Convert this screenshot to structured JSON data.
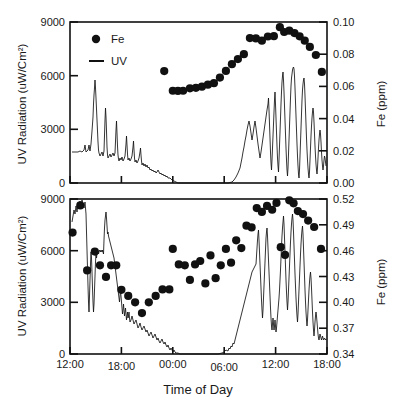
{
  "figure": {
    "background_color": "#ffffff",
    "ink_color": "#111111",
    "xlabel": "Time of Day",
    "panels": [
      {
        "id": "top-panel",
        "left_axis_title": "UV Radiation (uW/Cm²)",
        "right_axis_title": "Fe (ppm)",
        "left_ticks": [
          "0",
          "3000",
          "6000",
          "9000"
        ],
        "right_ticks": [
          "0.00",
          "0.02",
          "0.04",
          "0.06",
          "0.08",
          "0.10"
        ],
        "x_ticks": [
          "12:00",
          "18:00",
          "00:00",
          "06:00",
          "12:00",
          "18:00"
        ],
        "legend": [
          {
            "label": "Fe",
            "marker": "filled-circle"
          },
          {
            "label": "UV",
            "marker": "line"
          }
        ]
      },
      {
        "id": "bottom-panel",
        "left_axis_title": "UV Radiation (uW/Cm²)",
        "right_axis_title": "Fe (ppm)",
        "left_ticks": [
          "0",
          "3000",
          "6000",
          "9000"
        ],
        "right_ticks": [
          "0.34",
          "0.37",
          "0.40",
          "0.43",
          "0.46",
          "0.49",
          "0.52"
        ],
        "x_ticks": [
          "12:00",
          "18:00",
          "00:00",
          "06:00",
          "12:00",
          "18:00"
        ]
      }
    ]
  },
  "chart_data": [
    {
      "type": "scatter",
      "id": "top-panel",
      "title": "",
      "xlabel": "Time of Day",
      "ylabel": "UV Radiation (uW/Cm²)",
      "y2label": "Fe (ppm)",
      "xlim": [
        12,
        42
      ],
      "x_tick_values": [
        12,
        18,
        24,
        30,
        36,
        42
      ],
      "x_tick_labels": [
        "12:00",
        "18:00",
        "00:00",
        "06:00",
        "12:00",
        "18:00"
      ],
      "ylim": [
        0,
        9000
      ],
      "y_tick_values": [
        0,
        3000,
        6000,
        9000
      ],
      "y2lim": [
        0.0,
        0.1
      ],
      "y2_tick_values": [
        0.0,
        0.02,
        0.04,
        0.06,
        0.08,
        0.1
      ],
      "grid": false,
      "legend_position": "upper-left",
      "series": [
        {
          "name": "Fe",
          "type": "scatter",
          "axis": "y2",
          "marker": "filled-circle",
          "color": "#111111",
          "x": [
            23.0,
            24.0,
            24.6,
            25.2,
            26.0,
            26.7,
            27.4,
            28.1,
            28.8,
            29.5,
            30.2,
            30.9,
            31.6,
            32.3,
            33.0,
            33.7,
            34.4,
            35.1,
            35.8,
            36.5,
            37.0,
            37.6,
            38.2,
            38.8,
            39.4,
            40.0,
            40.7,
            41.4
          ],
          "y": [
            0.0695,
            0.0573,
            0.0572,
            0.0573,
            0.0588,
            0.0591,
            0.0598,
            0.0611,
            0.062,
            0.0655,
            0.0696,
            0.0738,
            0.077,
            0.08,
            0.09,
            0.0898,
            0.0884,
            0.091,
            0.0912,
            0.0968,
            0.0938,
            0.0946,
            0.0931,
            0.0911,
            0.0884,
            0.0845,
            0.0795,
            0.069
          ]
        },
        {
          "name": "UV",
          "type": "line",
          "axis": "y1",
          "color": "#111111",
          "description": "Spiky UV radiation trace: morning-to-afternoon spikes near 12:00-18:00 reaching ~5800, decaying to 0 after ~19:30; flat zero overnight; rising from ~06:30 to broad spiky plateau 09:00-16:00 peaking ~8000; falls off after 17:00."
        }
      ]
    },
    {
      "type": "scatter",
      "id": "bottom-panel",
      "title": "",
      "xlabel": "Time of Day",
      "ylabel": "UV Radiation (uW/Cm²)",
      "y2label": "Fe (ppm)",
      "xlim": [
        12,
        42
      ],
      "x_tick_values": [
        12,
        18,
        24,
        30,
        36,
        42
      ],
      "x_tick_labels": [
        "12:00",
        "18:00",
        "00:00",
        "06:00",
        "12:00",
        "18:00"
      ],
      "ylim": [
        0,
        9000
      ],
      "y_tick_values": [
        0,
        3000,
        6000,
        9000
      ],
      "y2lim": [
        0.34,
        0.52
      ],
      "y2_tick_values": [
        0.34,
        0.37,
        0.4,
        0.43,
        0.46,
        0.49,
        0.52
      ],
      "grid": false,
      "legend_position": "none",
      "series": [
        {
          "name": "Fe",
          "type": "scatter",
          "axis": "y2",
          "marker": "filled-circle",
          "color": "#111111",
          "x": [
            12.3,
            13.2,
            14.0,
            14.9,
            15.5,
            16.2,
            16.8,
            17.4,
            18.0,
            18.8,
            19.6,
            20.4,
            21.2,
            22.0,
            22.8,
            23.6,
            24.0,
            24.7,
            25.4,
            26.0,
            26.6,
            27.2,
            27.8,
            28.4,
            29.0,
            29.6,
            30.2,
            30.8,
            31.4,
            32.0,
            32.6,
            33.2,
            33.8,
            34.4,
            35.0,
            35.6,
            36.1,
            36.6,
            37.1,
            37.6,
            38.1,
            38.6,
            39.2,
            39.8,
            40.5,
            41.3
          ],
          "y": [
            0.481,
            0.5125,
            0.437,
            0.459,
            0.443,
            0.4295,
            0.443,
            0.443,
            0.4145,
            0.4075,
            0.4,
            0.3875,
            0.4,
            0.4075,
            0.415,
            0.415,
            0.462,
            0.444,
            0.443,
            0.426,
            0.444,
            0.448,
            0.422,
            0.4545,
            0.428,
            0.443,
            0.462,
            0.446,
            0.472,
            0.463,
            0.489,
            0.487,
            0.5095,
            0.505,
            0.512,
            0.5075,
            0.5155,
            0.464,
            0.455,
            0.5185,
            0.515,
            0.506,
            0.5025,
            0.495,
            0.4875,
            0.462
          ]
        },
        {
          "name": "UV",
          "type": "line",
          "axis": "y1",
          "color": "#111111",
          "description": "UV trace starts high near 8800 at 12:00 with dense spikes between 13:00-16:00 reaching 6000-8800, then decays steadily to 0 by ~19:00; flat zero overnight; rises from ~06:00 to dense heavy spikes 10:30-13:30 reaching ~7800, then drops to ~1900."
        }
      ]
    }
  ]
}
